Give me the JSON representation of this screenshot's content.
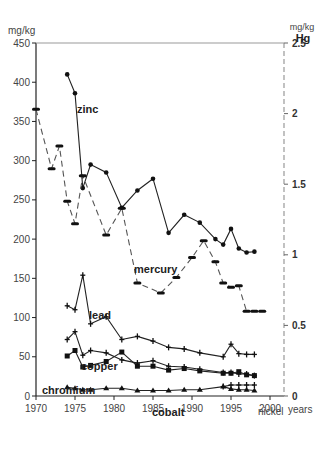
{
  "chart_data": {
    "type": "line",
    "title": "",
    "xlabel": "years",
    "ylabel": "mg/kg",
    "y2label": "mg/kg Hg",
    "xlim": [
      1970,
      2002
    ],
    "ylim": [
      0,
      450
    ],
    "y2lim": [
      0,
      2.5
    ],
    "x_ticks": [
      1970,
      1975,
      1980,
      1985,
      1990,
      1995,
      2000
    ],
    "y_ticks": [
      0,
      50,
      100,
      150,
      200,
      250,
      300,
      350,
      400,
      450
    ],
    "y2_ticks": [
      "0",
      "0.5",
      "1",
      "1.5",
      "2",
      "2.5"
    ],
    "grid": false,
    "legend": "inline labels",
    "series": [
      {
        "name": "zinc",
        "axis": "left",
        "style": "solid",
        "marker": "dot",
        "x": [
          1974,
          1975,
          1976,
          1977,
          1979,
          1981,
          1983,
          1985,
          1987,
          1989,
          1991,
          1993,
          1994,
          1995,
          1996,
          1997,
          1998
        ],
        "values": [
          410,
          386,
          265,
          295,
          285,
          240,
          262,
          277,
          208,
          231,
          221,
          200,
          193,
          213,
          188,
          183,
          184
        ]
      },
      {
        "name": "mercury",
        "axis": "right",
        "style": "dashed",
        "marker": "dash",
        "x": [
          1970,
          1972,
          1973,
          1974,
          1975,
          1976,
          1979,
          1981,
          1983,
          1986,
          1988,
          1990,
          1991.5,
          1993,
          1994,
          1995,
          1996,
          1997,
          1998,
          1999
        ],
        "values": [
          2.03,
          1.61,
          1.77,
          1.38,
          1.22,
          1.56,
          1.14,
          1.33,
          0.8,
          0.73,
          0.84,
          0.98,
          1.1,
          0.95,
          0.8,
          0.77,
          0.78,
          0.6,
          0.6,
          0.6
        ]
      },
      {
        "name": "lead",
        "axis": "left",
        "style": "solid",
        "marker": "plus",
        "x": [
          1974,
          1975,
          1976,
          1977,
          1979,
          1981,
          1983,
          1985,
          1987,
          1989,
          1991,
          1994,
          1995,
          1996,
          1997,
          1998
        ],
        "values": [
          115,
          110,
          154,
          92,
          101,
          72,
          76,
          70,
          62,
          60,
          55,
          50,
          66,
          54,
          53,
          53
        ]
      },
      {
        "name": "copper",
        "axis": "left",
        "style": "solid",
        "marker": "plus",
        "x": [
          1974,
          1975,
          1976,
          1977,
          1979,
          1981,
          1983,
          1985,
          1987,
          1989,
          1991,
          1994,
          1995,
          1996,
          1997,
          1998
        ],
        "values": [
          72,
          82,
          52,
          58,
          55,
          46,
          42,
          45,
          38,
          37,
          34,
          30,
          30,
          28,
          28,
          26
        ]
      },
      {
        "name": "chromium",
        "axis": "left",
        "style": "solid",
        "marker": "square",
        "x": [
          1974,
          1975,
          1976,
          1977,
          1979,
          1981,
          1983,
          1985,
          1987,
          1989,
          1991,
          1994,
          1995,
          1996,
          1997,
          1998
        ],
        "values": [
          51,
          58,
          37,
          39,
          44,
          56,
          38,
          38,
          33,
          35,
          32,
          29,
          29,
          31,
          27,
          26
        ]
      },
      {
        "name": "cobalt",
        "axis": "left",
        "style": "solid",
        "marker": "triangle",
        "x": [
          1974,
          1975,
          1976,
          1977,
          1979,
          1981,
          1983,
          1985,
          1987,
          1989,
          1991,
          1994,
          1995,
          1996,
          1997,
          1998
        ],
        "values": [
          11,
          10,
          8,
          8,
          10,
          10,
          7,
          7,
          7,
          8,
          8,
          12,
          9,
          8,
          8,
          7
        ]
      },
      {
        "name": "nickel",
        "axis": "left",
        "style": "solid",
        "marker": "plus",
        "x": [
          1994,
          1995,
          1996,
          1997,
          1998
        ],
        "values": [
          12,
          14,
          14,
          14,
          14
        ]
      }
    ],
    "annotations": [
      "zinc",
      "mercury",
      "lead",
      "copper",
      "chromium",
      "cobalt",
      "nickel"
    ]
  },
  "labels": {
    "y_unit": "mg/kg",
    "y2_unit": "mg/kg",
    "y2_element": "Hg",
    "x_unit": "years",
    "zinc": "zinc",
    "mercury": "mercury",
    "lead": "lead",
    "copper": "copper",
    "chromium": "chromium",
    "cobalt": "cobalt",
    "nickel": "nickel"
  }
}
